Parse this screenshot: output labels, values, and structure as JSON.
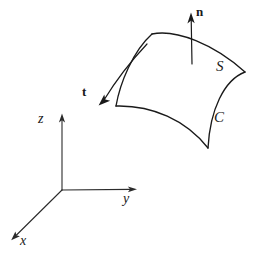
{
  "figure": {
    "type": "vector-calculus-diagram",
    "background_color": "#ffffff",
    "stroke_color": "#1a1a1a"
  },
  "axes": {
    "origin": {
      "x": 62,
      "y": 190
    },
    "items": [
      {
        "name": "z-axis",
        "label": "z",
        "label_x": 38,
        "label_y": 112,
        "tip_x": 62,
        "tip_y": 114
      },
      {
        "name": "y-axis",
        "label": "y",
        "label_x": 123,
        "label_y": 194,
        "tip_x": 137,
        "tip_y": 189
      },
      {
        "name": "x-axis",
        "label": "x",
        "label_x": 20,
        "label_y": 236,
        "tip_x": 11,
        "tip_y": 239
      }
    ]
  },
  "surface": {
    "label": "S",
    "label_x": 216,
    "label_y": 58,
    "corners": [
      {
        "name": "top-left",
        "x": 152,
        "y": 34
      },
      {
        "name": "top-right",
        "x": 245,
        "y": 72
      },
      {
        "name": "bottom-right",
        "x": 208,
        "y": 148
      },
      {
        "name": "bottom-left",
        "x": 116,
        "y": 106
      }
    ]
  },
  "boundary_curve": {
    "label": "C",
    "label_x": 214,
    "label_y": 110
  },
  "normal_vector": {
    "label": "n",
    "label_x": 196,
    "label_y": 6,
    "tail_x": 192,
    "tail_y": 64,
    "tip_x": 191,
    "tip_y": 13
  },
  "tangent_vector": {
    "label": "t",
    "label_x": 82,
    "label_y": 85,
    "tail_x": 147,
    "tail_y": 44,
    "tip_x": 99,
    "tip_y": 105
  }
}
